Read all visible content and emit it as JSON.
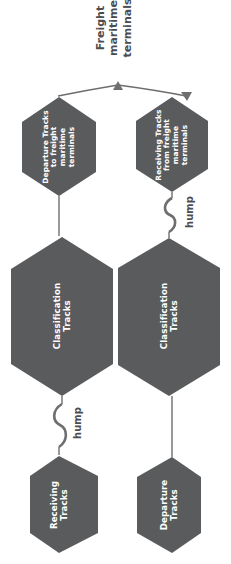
{
  "diagram": {
    "title_annotation": {
      "name": "freight-maritime-terminals",
      "lines": [
        "Freight",
        "maritime",
        "terminals"
      ]
    },
    "nodes": [
      {
        "id": "departure-tracks-to-terminals",
        "lines": [
          "Departure Tracks",
          "to freight",
          "maritime",
          "terminals"
        ],
        "fill": "#5a5b5d"
      },
      {
        "id": "receiving-tracks-from-terminals",
        "lines": [
          "Receiving Tracks",
          "from freight",
          "maritime",
          "terminals"
        ],
        "fill": "#5a5b5d"
      },
      {
        "id": "classification-tracks-left",
        "lines": [
          "Classification",
          "Tracks"
        ],
        "fill": "#5a5b5d"
      },
      {
        "id": "classification-tracks-right",
        "lines": [
          "Classification",
          "Tracks"
        ],
        "fill": "#5a5b5d"
      },
      {
        "id": "receiving-tracks",
        "lines": [
          "Receiving",
          "Tracks"
        ],
        "fill": "#5a5b5d"
      },
      {
        "id": "departure-tracks",
        "lines": [
          "Departure",
          "Tracks"
        ],
        "fill": "#5a5b5d"
      }
    ],
    "connector_labels": [
      {
        "id": "hump-upper",
        "text": "hump"
      },
      {
        "id": "hump-lower",
        "text": "hump"
      }
    ],
    "colors": {
      "background": "#ffffff",
      "node_fill": "#5a5b5d",
      "connector": "#6d6e70",
      "node_text": "#ffffff",
      "annotation_text": "#4c4d4f"
    }
  }
}
